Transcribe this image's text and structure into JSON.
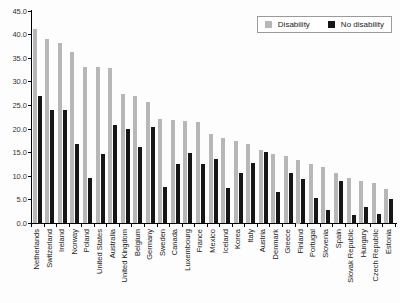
{
  "chart_data": {
    "type": "bar",
    "title": "",
    "xlabel": "",
    "ylabel": "",
    "categories": [
      "Netherlands",
      "Switzerland",
      "Ireland",
      "Norway",
      "Poland",
      "United States",
      "Australia",
      "United Kingdom",
      "Belgium",
      "Germany",
      "Sweden",
      "Canada",
      "Luxembourg",
      "France",
      "Mexico",
      "Iceland",
      "Korea",
      "Italy",
      "Austria",
      "Denmark",
      "Greece",
      "Finland",
      "Portugal",
      "Slovenia",
      "Spain",
      "Slovak Republic",
      "Hungary",
      "Czech Republic",
      "Estonia"
    ],
    "series": [
      {
        "name": "Disability",
        "color": "#b7b7b7",
        "texture": "dotted",
        "values": [
          41.1,
          39.0,
          38.3,
          36.3,
          33.2,
          33.1,
          33.0,
          27.4,
          26.9,
          25.8,
          22.1,
          21.9,
          21.7,
          21.4,
          19.0,
          18.1,
          17.5,
          16.8,
          15.6,
          14.7,
          14.2,
          13.5,
          12.5,
          11.9,
          10.6,
          9.6,
          8.9,
          8.6,
          7.4
        ]
      },
      {
        "name": "No disability",
        "color": "#161616",
        "texture": "solid",
        "values": [
          27.0,
          24.0,
          24.0,
          16.8,
          9.7,
          14.7,
          20.9,
          20.0,
          16.1,
          20.4,
          7.8,
          12.6,
          15.0,
          12.5,
          13.6,
          7.5,
          10.8,
          12.8,
          15.2,
          6.7,
          10.6,
          9.4,
          5.5,
          2.9,
          9.1,
          1.8,
          3.6,
          2.0,
          5.1
        ]
      }
    ],
    "ylim": [
      0,
      45
    ],
    "ytick_step": 5,
    "ytick_labels": [
      "0.0",
      "5.0",
      "10.0",
      "15.0",
      "20.0",
      "25.0",
      "30.0",
      "35.0",
      "40.0",
      "45.0"
    ],
    "grid": false,
    "legend_position": "top-right"
  }
}
